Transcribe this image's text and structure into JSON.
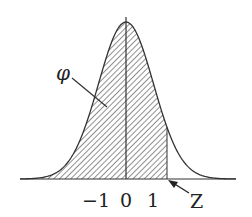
{
  "figure": {
    "type": "normal distribution curve with shaded cumulative area",
    "area_label": "φ",
    "z_label": "Z",
    "tick_labels": [
      "−1",
      "0",
      "1"
    ],
    "z_value_approx": 1.5
  },
  "chart_data": {
    "type": "area",
    "title": "",
    "xlabel": "",
    "ylabel": "",
    "curve": "standard normal density",
    "x_ticks": [
      -1,
      0,
      1
    ],
    "tick_labels": [
      "−1",
      "0",
      "1"
    ],
    "shaded_region": {
      "from": "-inf",
      "to": "Z",
      "z_approx": 1.5,
      "label": "φ"
    },
    "annotations": [
      {
        "text": "φ",
        "points_to": "shaded area"
      },
      {
        "text": "Z",
        "points_to": "right edge of shaded area on x-axis"
      }
    ],
    "grid": false
  },
  "colors": {
    "ink": "#222222",
    "background": "#ffffff"
  }
}
